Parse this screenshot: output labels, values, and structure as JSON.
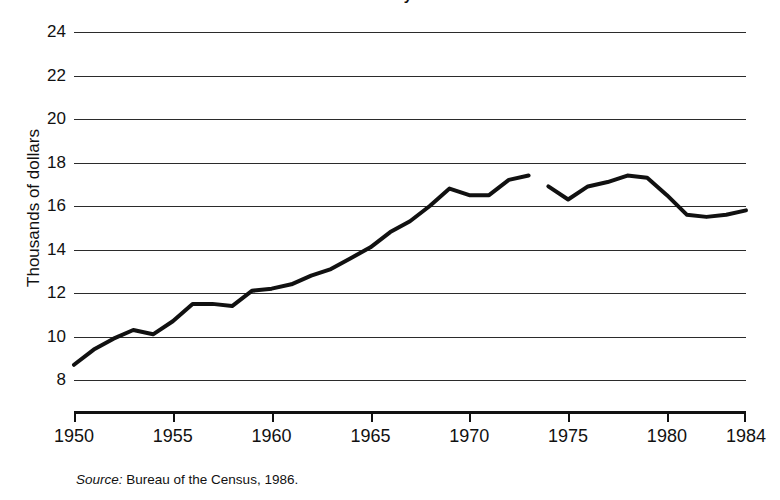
{
  "figure": {
    "title_partial": "median family income",
    "source_prefix": "Source:",
    "source_text": "Bureau of the Census, 1986.",
    "line_color": "#111111",
    "grid_color": "#2b2b2b",
    "axis_color": "#111111"
  },
  "chart_data": {
    "type": "line",
    "title": "median family income",
    "xlabel": "",
    "ylabel": "Thousands of dollars",
    "xlim": [
      1950,
      1984
    ],
    "ylim": [
      8,
      24
    ],
    "grid": true,
    "legend": "none",
    "xticks": [
      1950,
      1955,
      1960,
      1965,
      1970,
      1975,
      1980,
      1984
    ],
    "xtick_labels": [
      "1950",
      "1955",
      "1960",
      "1965",
      "1970",
      "1975",
      "1980",
      "1984"
    ],
    "yticks": [
      8,
      10,
      12,
      14,
      16,
      18,
      20,
      22,
      24
    ],
    "ytick_labels": [
      "8",
      "10",
      "12",
      "14",
      "16",
      "18",
      "20",
      "22",
      "24"
    ],
    "x": [
      1950,
      1951,
      1952,
      1953,
      1954,
      1955,
      1956,
      1957,
      1958,
      1959,
      1960,
      1961,
      1962,
      1963,
      1964,
      1965,
      1966,
      1967,
      1968,
      1969,
      1970,
      1971,
      1972,
      1973,
      1974,
      1975,
      1976,
      1977,
      1978,
      1979,
      1980,
      1981,
      1982,
      1983,
      1984
    ],
    "values": [
      8.7,
      9.4,
      9.9,
      10.3,
      10.1,
      10.7,
      11.5,
      11.5,
      11.4,
      12.1,
      12.2,
      12.4,
      12.8,
      13.1,
      13.6,
      14.1,
      14.8,
      15.3,
      16.0,
      16.8,
      16.5,
      16.5,
      17.2,
      17.4,
      16.9,
      16.3,
      16.9,
      17.1,
      17.4,
      17.3,
      16.5,
      15.6,
      15.5,
      15.6,
      15.8
    ],
    "break_after_year": 1973,
    "annotations": []
  },
  "axis_titles": {
    "y": "Thousands of dollars"
  }
}
